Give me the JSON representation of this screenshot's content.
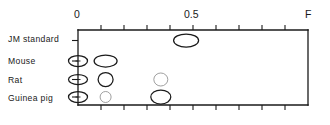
{
  "figure": {
    "type": "chromatogram-spot-plot",
    "axis_end_label": "F",
    "plot_box": {
      "x": 78,
      "y": 30,
      "width": 230,
      "height": 75
    }
  },
  "chart_data": {
    "type": "scatter",
    "title": "",
    "xlabel": "",
    "ylabel": "",
    "xlim": [
      0,
      1.0
    ],
    "axis_tick_labels": [
      "0",
      "0.5"
    ],
    "axis_tick_values": [
      0,
      0.5
    ],
    "axis_end_label": "F",
    "minor_tick_step": 0.1,
    "grid": false,
    "legend": "none",
    "categories": [
      "JM standard",
      "Mouse",
      "Rat",
      "Guinea pig"
    ],
    "series": [
      {
        "name": "JM standard",
        "row": 0,
        "spots": [
          {
            "rf": 0.47,
            "rx": 12.5,
            "ry": 6.5,
            "intensity": "strong"
          }
        ]
      },
      {
        "name": "Mouse",
        "row": 1,
        "spots": [
          {
            "rf": 0.0,
            "rx": 9.5,
            "ry": 5.5,
            "intensity": "strong"
          },
          {
            "rf": 0.12,
            "rx": 11.5,
            "ry": 6.0,
            "intensity": "strong"
          }
        ]
      },
      {
        "name": "Rat",
        "row": 2,
        "spots": [
          {
            "rf": 0.0,
            "rx": 9.5,
            "ry": 5.0,
            "intensity": "strong"
          },
          {
            "rf": 0.12,
            "rx": 7.5,
            "ry": 7.0,
            "intensity": "strong"
          },
          {
            "rf": 0.36,
            "rx": 7.0,
            "ry": 6.5,
            "intensity": "faint"
          }
        ]
      },
      {
        "name": "Guinea pig",
        "row": 3,
        "spots": [
          {
            "rf": 0.0,
            "rx": 9.5,
            "ry": 5.5,
            "intensity": "strong"
          },
          {
            "rf": 0.12,
            "rx": 5.5,
            "ry": 5.5,
            "intensity": "faint"
          },
          {
            "rf": 0.36,
            "rx": 10.0,
            "ry": 7.0,
            "intensity": "strong"
          }
        ]
      }
    ]
  },
  "labels": {
    "row_labels": [
      {
        "text": "JM standard",
        "top": 34
      },
      {
        "text": "Mouse",
        "top": 56
      },
      {
        "text": "Rat",
        "top": 75
      },
      {
        "text": "Guinea pig",
        "top": 93
      }
    ],
    "tick_labels": [
      {
        "text": "0",
        "left": 74
      },
      {
        "text": "0.5",
        "left": 184
      }
    ],
    "end_label": {
      "text": "F",
      "left": 305
    }
  },
  "colors": {
    "ink": "#1a1a1a",
    "faint_ink": "#8f8f8f",
    "background": "#ffffff"
  }
}
